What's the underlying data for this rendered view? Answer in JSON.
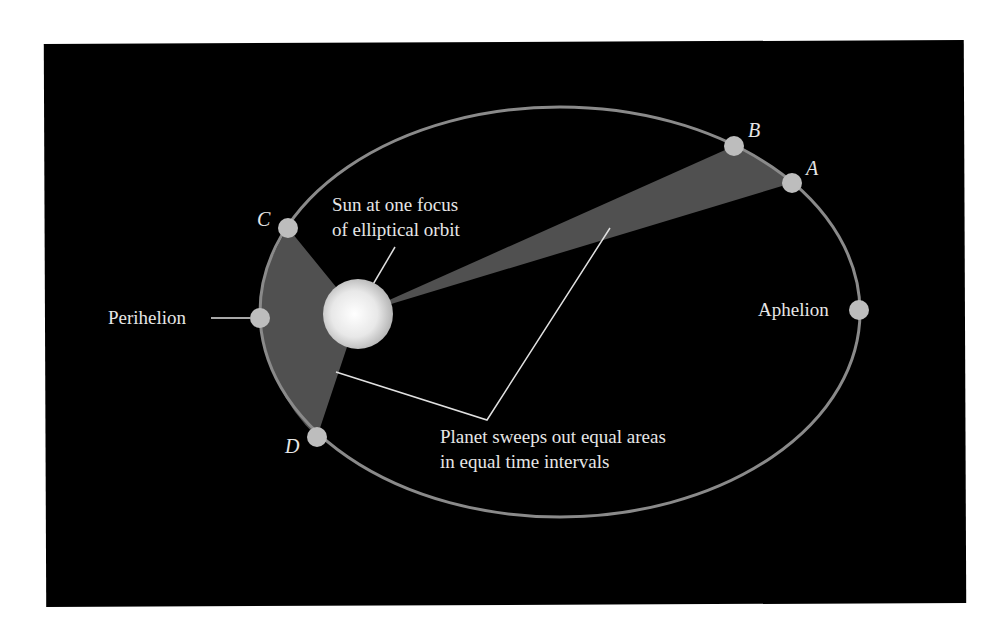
{
  "diagram": {
    "colors": {
      "background": "#000000",
      "page": "#ffffff",
      "orbit": "#8a8a8a",
      "sector": "#505050",
      "planet": "#bdbdbd",
      "text": "#e6e6e6",
      "sun_center": "#ffffff",
      "sun_edge": "#bfbfbf"
    },
    "orbit": {
      "cx": 560,
      "cy": 312,
      "rx": 300,
      "ry": 205
    },
    "sun": {
      "cx": 358,
      "cy": 314,
      "r": 35,
      "label_line1": "Sun at one focus",
      "label_line2": "of elliptical orbit"
    },
    "points": [
      {
        "id": "A",
        "label": "A",
        "x": 792,
        "y": 183
      },
      {
        "id": "B",
        "label": "B",
        "x": 734,
        "y": 146
      },
      {
        "id": "C",
        "label": "C",
        "x": 288,
        "y": 228
      },
      {
        "id": "D",
        "label": "D",
        "x": 317,
        "y": 437
      },
      {
        "id": "perihelion",
        "label": "Perihelion",
        "x": 260,
        "y": 318
      },
      {
        "id": "aphelion",
        "label": "Aphelion",
        "x": 859,
        "y": 310
      }
    ],
    "annotation": {
      "line1": "Planet sweeps out equal areas",
      "line2": "in equal time intervals"
    },
    "labels": {
      "perihelion": "Perihelion",
      "aphelion": "Aphelion",
      "A": "A",
      "B": "B",
      "C": "C",
      "D": "D"
    }
  }
}
